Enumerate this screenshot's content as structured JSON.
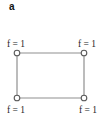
{
  "figure": {
    "panel_label": "a",
    "graph": {
      "type": "undirected-graph",
      "shape": "rectangle-cycle",
      "nodes": [
        {
          "id": "top-left",
          "label": "f = 1"
        },
        {
          "id": "top-right",
          "label": "f = 1"
        },
        {
          "id": "bottom-left",
          "label": "f = 1"
        },
        {
          "id": "bottom-right",
          "label": "f = 1"
        }
      ],
      "edges": [
        {
          "from": "top-left",
          "to": "top-right"
        },
        {
          "from": "top-right",
          "to": "bottom-right"
        },
        {
          "from": "bottom-right",
          "to": "bottom-left"
        },
        {
          "from": "bottom-left",
          "to": "top-left"
        }
      ]
    },
    "colors": {
      "background": "#ffffff",
      "edge": "#8f8f8f",
      "node_stroke": "#5a5a5a",
      "node_fill": "#ffffff",
      "label_text": "#262626",
      "panel_label_text": "#111111"
    }
  }
}
